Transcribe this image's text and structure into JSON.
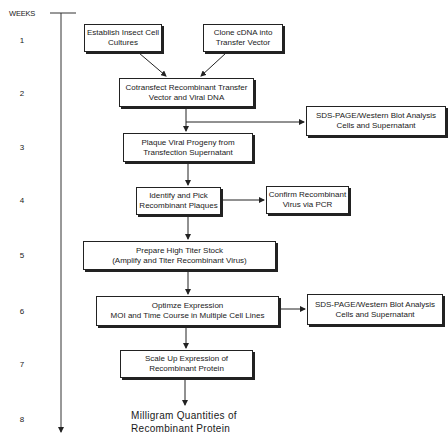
{
  "timeline": {
    "title": "WEEKS",
    "weeks": [
      "1",
      "2",
      "3",
      "4",
      "5",
      "6",
      "7",
      "8"
    ]
  },
  "steps": {
    "establish_cells": {
      "line1": "Establish Insect Cell",
      "line2": "Cultures"
    },
    "clone_cdna": {
      "line1": "Clone cDNA into",
      "line2": "Transfer Vector"
    },
    "cotransfect": {
      "line1": "Cotransfect Recombinant Transfer",
      "line2": "Vector and Viral DNA"
    },
    "sds_page_1": {
      "line1": "SDS-PAGE/Western Blot Analysis",
      "line2": "Cells and Supernatant"
    },
    "plaque": {
      "line1": "Plaque Viral Progeny from",
      "line2": "Transfection Supernatant"
    },
    "identify": {
      "line1": "Identify and Pick",
      "line2": "Recombinant Plaques"
    },
    "confirm": {
      "line1": "Confirm Recombinant",
      "line2": "Virus via PCR"
    },
    "prepare_stock": {
      "line1": "Prepare High Titer Stock",
      "line2": "(Amplify and Titer  Recombinant Virus)"
    },
    "optimize": {
      "line1": "Optimze Expression",
      "line2": "MOI and Time Course in Multiple Cell Lines"
    },
    "sds_page_2": {
      "line1": "SDS-PAGE/Western Blot Analysis",
      "line2": "Cells and Supernatant"
    },
    "scale_up": {
      "line1": "Scale Up Expression of",
      "line2": "Recombinant Protein"
    }
  },
  "outcome": {
    "line1": "Milligram  Quantities  of",
    "line2": "Recombinant  Protein"
  }
}
